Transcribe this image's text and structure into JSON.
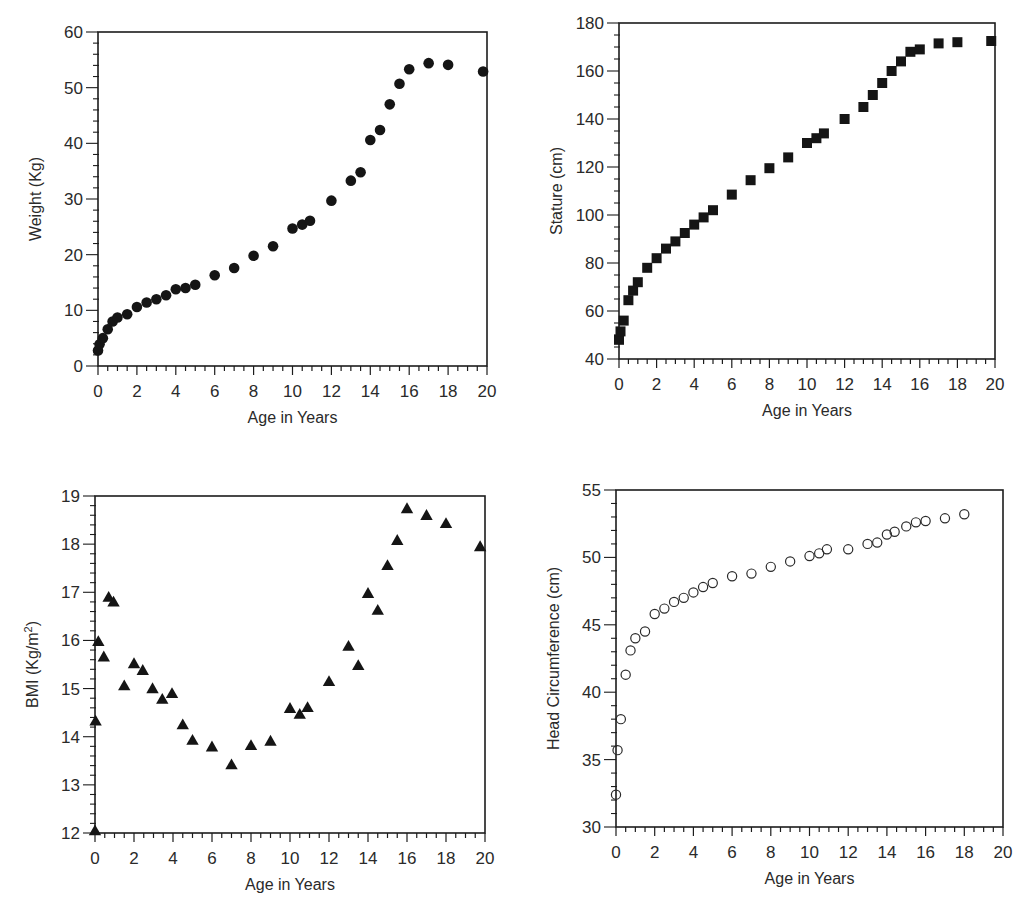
{
  "chart_data": [
    {
      "type": "scatter",
      "id": "weight",
      "title": "",
      "xlabel": "Age in Years",
      "ylabel": "Weight (Kg)",
      "xlim": [
        0,
        20
      ],
      "ylim": [
        0,
        60
      ],
      "xticks": [
        0,
        2,
        4,
        6,
        8,
        10,
        12,
        14,
        16,
        18,
        20
      ],
      "yticks": [
        0,
        10,
        20,
        30,
        40,
        50,
        60
      ],
      "x_minor_step": 0.5,
      "y_minor_step": 2,
      "marker": "filled-circle",
      "grid": false,
      "legend": null,
      "x": [
        0,
        0.08,
        0.25,
        0.5,
        0.75,
        1,
        1.5,
        2,
        2.5,
        3,
        3.5,
        4,
        4.5,
        5,
        6,
        7,
        8,
        9,
        10,
        10.5,
        10.9,
        12,
        13,
        13.5,
        14,
        14.5,
        15,
        15.5,
        16,
        17,
        18,
        19.8
      ],
      "y": [
        2.8,
        3.9,
        5.0,
        6.6,
        8.0,
        8.7,
        9.3,
        10.6,
        11.4,
        12.0,
        12.7,
        13.8,
        14.0,
        14.6,
        16.3,
        17.6,
        19.8,
        21.5,
        24.7,
        25.4,
        26.1,
        29.7,
        33.3,
        34.8,
        40.6,
        42.4,
        47.0,
        50.7,
        53.3,
        54.4,
        54.1,
        52.9
      ]
    },
    {
      "type": "scatter",
      "id": "stature",
      "title": "",
      "xlabel": "Age in Years",
      "ylabel": "Stature (cm)",
      "xlim": [
        0,
        20
      ],
      "ylim": [
        40,
        180
      ],
      "xticks": [
        0,
        2,
        4,
        6,
        8,
        10,
        12,
        14,
        16,
        18,
        20
      ],
      "yticks": [
        40,
        60,
        80,
        100,
        120,
        140,
        160,
        180
      ],
      "x_minor_step": 0.5,
      "y_minor_step": 5,
      "marker": "filled-square",
      "grid": false,
      "legend": null,
      "x": [
        0,
        0.08,
        0.25,
        0.5,
        0.75,
        1,
        1.5,
        2,
        2.5,
        3,
        3.5,
        4,
        4.5,
        5,
        6,
        7,
        8,
        9,
        10,
        10.5,
        10.9,
        12,
        13,
        13.5,
        14,
        14.5,
        15,
        15.5,
        16,
        17,
        18,
        19.8
      ],
      "y": [
        48,
        51.5,
        56,
        64.5,
        68.5,
        72,
        78,
        82,
        86,
        89,
        92.5,
        96,
        99,
        102,
        108.5,
        114.5,
        119.5,
        124,
        130,
        132,
        134,
        140,
        145,
        150,
        155,
        160,
        164,
        168,
        169,
        171.5,
        172,
        172.5
      ]
    },
    {
      "type": "scatter",
      "id": "bmi",
      "title": "",
      "xlabel": "Age in Years",
      "ylabel": "BMI (Kg/m2)",
      "ylabel_main": "BMI (Kg/m",
      "ylabel_sup": "2",
      "ylabel_close": ")",
      "xlim": [
        0,
        20
      ],
      "ylim": [
        12,
        19
      ],
      "xticks": [
        0,
        2,
        4,
        6,
        8,
        10,
        12,
        14,
        16,
        18,
        20
      ],
      "yticks": [
        12,
        13,
        14,
        15,
        16,
        17,
        18,
        19
      ],
      "x_minor_step": 0.5,
      "y_minor_step": 0.2,
      "marker": "filled-triangle",
      "grid": false,
      "legend": null,
      "x": [
        0,
        0.03,
        0.17,
        0.45,
        0.7,
        0.95,
        1.5,
        2,
        2.45,
        2.95,
        3.45,
        3.95,
        4.5,
        5,
        6,
        7,
        8,
        9,
        10,
        10.5,
        10.9,
        12,
        13,
        13.5,
        14,
        14.5,
        15,
        15.5,
        16,
        17,
        18,
        19.75
      ],
      "y": [
        12.05,
        14.33,
        15.98,
        15.66,
        16.9,
        16.8,
        15.06,
        15.52,
        15.38,
        15.0,
        14.78,
        14.9,
        14.25,
        13.93,
        13.79,
        13.42,
        13.82,
        13.91,
        14.59,
        14.47,
        14.61,
        15.15,
        15.88,
        15.48,
        16.98,
        16.63,
        17.56,
        18.08,
        18.74,
        18.6,
        18.43,
        17.95
      ]
    },
    {
      "type": "scatter",
      "id": "head-circumference",
      "title": "",
      "xlabel": "Age in Years",
      "ylabel": "Head Circumference (cm)",
      "xlim": [
        0,
        20
      ],
      "ylim": [
        30,
        55
      ],
      "xticks": [
        0,
        2,
        4,
        6,
        8,
        10,
        12,
        14,
        16,
        18,
        20
      ],
      "yticks": [
        30,
        35,
        40,
        45,
        50,
        55
      ],
      "x_minor_step": 0.5,
      "y_minor_step": 1,
      "marker": "open-circle",
      "grid": false,
      "legend": null,
      "x": [
        0,
        0.08,
        0.25,
        0.5,
        0.75,
        1,
        1.5,
        2,
        2.5,
        3,
        3.5,
        4,
        4.5,
        5,
        6,
        7,
        8,
        9,
        10,
        10.5,
        10.9,
        12,
        13,
        13.5,
        14,
        14.4,
        15,
        15.5,
        16,
        17,
        18
      ],
      "y": [
        32.4,
        35.7,
        38.0,
        41.3,
        43.1,
        44.0,
        44.5,
        45.8,
        46.2,
        46.7,
        47.0,
        47.4,
        47.8,
        48.1,
        48.6,
        48.8,
        49.3,
        49.7,
        50.1,
        50.3,
        50.6,
        50.6,
        51.0,
        51.1,
        51.7,
        51.9,
        52.3,
        52.6,
        52.7,
        52.9,
        53.2
      ]
    }
  ],
  "layout": {
    "panels": [
      {
        "id": "weight",
        "left": 98,
        "top": 32,
        "right": 487,
        "bottom": 366
      },
      {
        "id": "stature",
        "left": 619,
        "top": 23,
        "right": 995,
        "bottom": 359
      },
      {
        "id": "bmi",
        "left": 95,
        "top": 496,
        "right": 485,
        "bottom": 833
      },
      {
        "id": "head-circumference",
        "left": 616,
        "top": 490,
        "right": 1003,
        "bottom": 827
      }
    ]
  }
}
